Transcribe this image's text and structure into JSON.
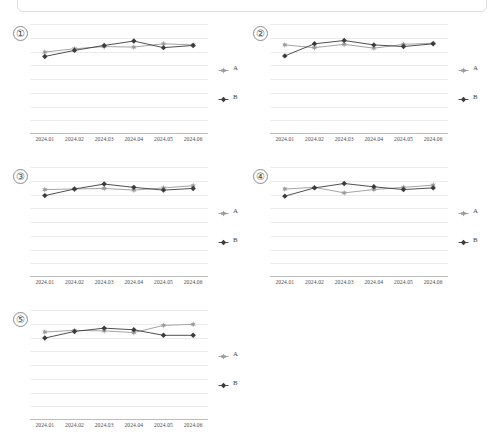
{
  "page": {
    "background": "#ffffff",
    "frame_visible": true
  },
  "chart_data": [
    {
      "type": "line",
      "panel_label": "①",
      "title": "",
      "xlabel": "",
      "ylabel": "",
      "categories": [
        "2024.01",
        "2024.02",
        "2024.03",
        "2024.04",
        "2024.05",
        "2024.06"
      ],
      "ylim": [
        0,
        10
      ],
      "grid": true,
      "legend_position": "right",
      "series": [
        {
          "name": "A",
          "color": "#9a9a9a",
          "marker": "star",
          "values": [
            7.45,
            7.75,
            7.95,
            7.9,
            8.2,
            8.1
          ]
        },
        {
          "name": "B",
          "color": "#3c3c3c",
          "marker": "diamond",
          "values": [
            7.05,
            7.6,
            8.05,
            8.45,
            7.85,
            8.05
          ]
        }
      ]
    },
    {
      "type": "line",
      "panel_label": "②",
      "title": "",
      "xlabel": "",
      "ylabel": "",
      "categories": [
        "2024.01",
        "2024.02",
        "2024.03",
        "2024.04",
        "2024.05",
        "2024.06"
      ],
      "ylim": [
        0,
        10
      ],
      "grid": true,
      "legend_position": "right",
      "series": [
        {
          "name": "A",
          "color": "#9a9a9a",
          "marker": "star",
          "values": [
            8.1,
            7.85,
            8.15,
            7.8,
            8.15,
            8.25
          ]
        },
        {
          "name": "B",
          "color": "#3c3c3c",
          "marker": "diamond",
          "values": [
            7.1,
            8.2,
            8.5,
            8.1,
            7.95,
            8.2
          ]
        }
      ]
    },
    {
      "type": "line",
      "panel_label": "③",
      "title": "",
      "xlabel": "",
      "ylabel": "",
      "categories": [
        "2024.01",
        "2024.02",
        "2024.03",
        "2024.04",
        "2024.05",
        "2024.06"
      ],
      "ylim": [
        0,
        10
      ],
      "grid": true,
      "legend_position": "right",
      "series": [
        {
          "name": "A",
          "color": "#9a9a9a",
          "marker": "star",
          "values": [
            7.95,
            8.0,
            8.05,
            7.9,
            8.1,
            8.3
          ]
        },
        {
          "name": "B",
          "color": "#3c3c3c",
          "marker": "diamond",
          "values": [
            7.4,
            8.0,
            8.45,
            8.15,
            7.9,
            8.05
          ]
        }
      ]
    },
    {
      "type": "line",
      "panel_label": "④",
      "title": "",
      "xlabel": "",
      "ylabel": "",
      "categories": [
        "2024.01",
        "2024.02",
        "2024.03",
        "2024.04",
        "2024.05",
        "2024.06"
      ],
      "ylim": [
        0,
        10
      ],
      "grid": true,
      "legend_position": "right",
      "series": [
        {
          "name": "A",
          "color": "#9a9a9a",
          "marker": "star",
          "values": [
            8.0,
            8.15,
            7.65,
            7.95,
            8.15,
            8.35
          ]
        },
        {
          "name": "B",
          "color": "#3c3c3c",
          "marker": "diamond",
          "values": [
            7.35,
            8.1,
            8.5,
            8.2,
            7.95,
            8.1
          ]
        }
      ]
    },
    {
      "type": "line",
      "panel_label": "⑤",
      "title": "",
      "xlabel": "",
      "ylabel": "",
      "categories": [
        "2024.01",
        "2024.02",
        "2024.03",
        "2024.04",
        "2024.05",
        "2024.06"
      ],
      "ylim": [
        0,
        10
      ],
      "grid": true,
      "legend_position": "right",
      "series": [
        {
          "name": "A",
          "color": "#9a9a9a",
          "marker": "star",
          "values": [
            8.0,
            8.15,
            8.1,
            7.95,
            8.6,
            8.7
          ]
        },
        {
          "name": "B",
          "color": "#3c3c3c",
          "marker": "diamond",
          "values": [
            7.45,
            8.05,
            8.35,
            8.2,
            7.7,
            7.7
          ]
        }
      ]
    }
  ],
  "legend": {
    "entries": [
      {
        "label": "A",
        "color": "#9a9a9a",
        "marker": "star"
      },
      {
        "label": "B",
        "color": "#3c3c3c",
        "marker": "diamond"
      }
    ]
  },
  "axis": {
    "gridline_count": 8,
    "gridline_color": "#ececec",
    "axis_color": "#bdbdbd",
    "tick_label_color": "#4d4d4d"
  }
}
